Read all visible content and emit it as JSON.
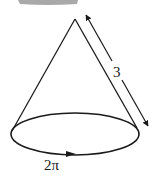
{
  "diagram": {
    "slant_height_label": "3",
    "base_circumference_label": "2π",
    "colors": {
      "stroke": "#1a1a1a",
      "top_bar": "#9a9a9a",
      "background": "#ffffff"
    }
  }
}
